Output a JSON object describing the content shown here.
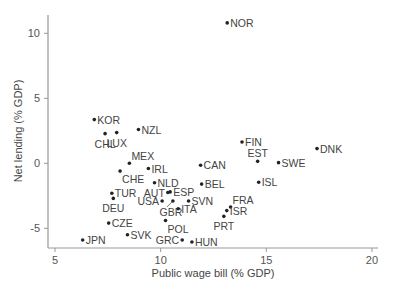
{
  "chart_data": {
    "type": "scatter",
    "title": "",
    "xlabel": "Public wage bill (% GDP)",
    "ylabel": "Net lending (% GDP)",
    "xlim": [
      4.7,
      20.0
    ],
    "ylim": [
      -6.5,
      11.5
    ],
    "xticks": [
      5,
      10,
      15,
      20
    ],
    "yticks": [
      -5,
      0,
      5,
      10
    ],
    "grid": false,
    "legend": null,
    "points": [
      {
        "label": "NOR",
        "x": 13.15,
        "y": 10.8,
        "pos": "right"
      },
      {
        "label": "KOR",
        "x": 6.86,
        "y": 3.36,
        "pos": "right"
      },
      {
        "label": "NZL",
        "x": 8.95,
        "y": 2.6,
        "pos": "right"
      },
      {
        "label": "CHL",
        "x": 7.37,
        "y": 2.28,
        "pos": "below"
      },
      {
        "label": "LUX",
        "x": 7.92,
        "y": 2.36,
        "pos": "below"
      },
      {
        "label": "FIN",
        "x": 13.85,
        "y": 1.64,
        "pos": "right"
      },
      {
        "label": "DNK",
        "x": 17.4,
        "y": 1.13,
        "pos": "right"
      },
      {
        "label": "EST",
        "x": 14.59,
        "y": 0.15,
        "pos": "above"
      },
      {
        "label": "SWE",
        "x": 15.58,
        "y": 0.05,
        "pos": "right"
      },
      {
        "label": "MEX",
        "x": 8.52,
        "y": 0.0,
        "pos": "above-right"
      },
      {
        "label": "CAN",
        "x": 11.89,
        "y": -0.15,
        "pos": "right"
      },
      {
        "label": "IRL",
        "x": 9.42,
        "y": -0.4,
        "pos": "right"
      },
      {
        "label": "CHE",
        "x": 8.08,
        "y": -0.6,
        "pos": "below-right"
      },
      {
        "label": "ISL",
        "x": 14.64,
        "y": -1.46,
        "pos": "right"
      },
      {
        "label": "NLD",
        "x": 9.71,
        "y": -1.5,
        "pos": "right"
      },
      {
        "label": "BEL",
        "x": 11.94,
        "y": -1.6,
        "pos": "right"
      },
      {
        "label": "ESP",
        "x": 10.45,
        "y": -2.2,
        "pos": "right"
      },
      {
        "label": "AUT",
        "x": 10.34,
        "y": -2.25,
        "pos": "left"
      },
      {
        "label": "TUR",
        "x": 7.69,
        "y": -2.3,
        "pos": "right"
      },
      {
        "label": "DEU",
        "x": 7.76,
        "y": -2.7,
        "pos": "below"
      },
      {
        "label": "USA",
        "x": 10.07,
        "y": -2.9,
        "pos": "left"
      },
      {
        "label": "GBR",
        "x": 10.58,
        "y": -2.9,
        "pos": "below-arrow"
      },
      {
        "label": "SVN",
        "x": 11.32,
        "y": -2.9,
        "pos": "right"
      },
      {
        "label": "FRA",
        "x": 13.31,
        "y": -3.36,
        "pos": "above-right"
      },
      {
        "label": "ITA",
        "x": 10.83,
        "y": -3.5,
        "pos": "right"
      },
      {
        "label": "ISR",
        "x": 13.13,
        "y": -3.64,
        "pos": "right"
      },
      {
        "label": "PRT",
        "x": 12.99,
        "y": -4.08,
        "pos": "below"
      },
      {
        "label": "POL",
        "x": 10.23,
        "y": -4.4,
        "pos": "below-right"
      },
      {
        "label": "CZE",
        "x": 7.54,
        "y": -4.6,
        "pos": "right"
      },
      {
        "label": "SVK",
        "x": 8.43,
        "y": -5.5,
        "pos": "right"
      },
      {
        "label": "JPN",
        "x": 6.31,
        "y": -5.9,
        "pos": "right"
      },
      {
        "label": "GRC",
        "x": 11.02,
        "y": -5.9,
        "pos": "left"
      },
      {
        "label": "HUN",
        "x": 11.48,
        "y": -6.05,
        "pos": "right"
      }
    ]
  },
  "colors": {
    "axis": "#999999",
    "point": "#222222",
    "label": "#444444"
  }
}
